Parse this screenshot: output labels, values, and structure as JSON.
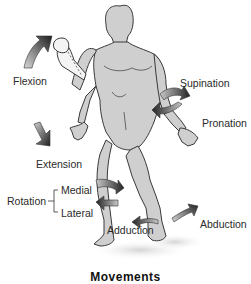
{
  "diagram": {
    "title": "Movements",
    "labels": {
      "flexion": "Flexion",
      "extension": "Extension",
      "supination": "Supination",
      "pronation": "Pronation",
      "rotation": "Rotation",
      "medial": "Medial",
      "lateral": "Lateral",
      "adduction": "Adduction",
      "abduction": "Abduction"
    },
    "colors": {
      "body_fill": "#cfcfcf",
      "body_stroke": "#3a3a3a",
      "arrow_dark": "#2b2b2b",
      "arrow_light": "#bdbdbd",
      "shadow": "#e2e2e2",
      "text": "#2a2a2a"
    }
  }
}
